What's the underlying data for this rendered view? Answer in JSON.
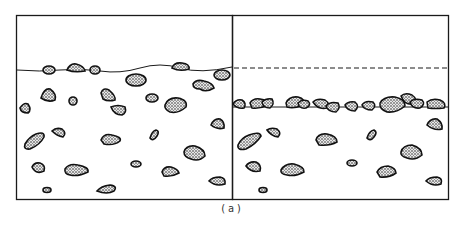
{
  "figure": {
    "caption": "(a)",
    "panels": [
      {
        "id": "left",
        "description": "particles dispersed in medium, some sitting at the wavy surface line"
      },
      {
        "id": "right",
        "description": "particles aggregated into a layer at an interface below the original surface (dashed line)"
      }
    ]
  },
  "colors": {
    "ink": "#1a1a1a",
    "particle_fill": "#9a9a9a",
    "background": "#ffffff"
  }
}
